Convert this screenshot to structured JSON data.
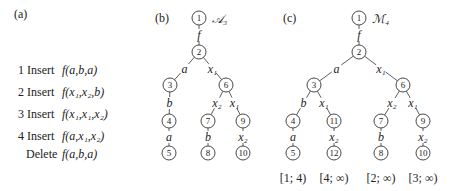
{
  "panel_a": {
    "tag": "(a)",
    "operations": [
      {
        "step": "1",
        "action": "Insert",
        "term": "f(a,b,a)"
      },
      {
        "step": "2",
        "action": "Insert",
        "term": "f(x₁,x₂,b)"
      },
      {
        "step": "3",
        "action": "Insert",
        "term": "f(x₁,x₁,x₂)"
      },
      {
        "step": "4",
        "action": "Insert",
        "term": "f(a,x₁,x₂)"
      },
      {
        "step": "",
        "action": "Delete",
        "term": "f(a,b,a)"
      }
    ]
  },
  "panel_b": {
    "tag": "(b)",
    "title": "𝒜₃",
    "nodes": [
      "1",
      "2",
      "3",
      "4",
      "5",
      "6",
      "7",
      "8",
      "9",
      "10"
    ],
    "edges": [
      {
        "from": "1",
        "to": "2",
        "label": "f"
      },
      {
        "from": "2",
        "to": "3",
        "label": "a"
      },
      {
        "from": "2",
        "to": "6",
        "label": "x₁"
      },
      {
        "from": "3",
        "to": "4",
        "label": "b"
      },
      {
        "from": "4",
        "to": "5",
        "label": "a"
      },
      {
        "from": "6",
        "to": "7",
        "label": "x₂"
      },
      {
        "from": "6",
        "to": "9",
        "label": "x₁"
      },
      {
        "from": "7",
        "to": "8",
        "label": "b"
      },
      {
        "from": "9",
        "to": "10",
        "label": "x₂"
      }
    ]
  },
  "panel_c": {
    "tag": "(c)",
    "title": "ℳ₄",
    "nodes": [
      "1",
      "2",
      "3",
      "4",
      "5",
      "11",
      "12",
      "6",
      "7",
      "8",
      "9",
      "10"
    ],
    "edges": [
      {
        "from": "1",
        "to": "2",
        "label": "f"
      },
      {
        "from": "2",
        "to": "3",
        "label": "a"
      },
      {
        "from": "2",
        "to": "6",
        "label": "x₁"
      },
      {
        "from": "3",
        "to": "4",
        "label": "b"
      },
      {
        "from": "3",
        "to": "11",
        "label": "x₁"
      },
      {
        "from": "4",
        "to": "5",
        "label": "a"
      },
      {
        "from": "11",
        "to": "12",
        "label": "x₂"
      },
      {
        "from": "6",
        "to": "7",
        "label": "x₂"
      },
      {
        "from": "6",
        "to": "9",
        "label": "x₁"
      },
      {
        "from": "7",
        "to": "8",
        "label": "b"
      },
      {
        "from": "9",
        "to": "10",
        "label": "x₂"
      }
    ],
    "leaf_intervals": [
      {
        "leaf": "5",
        "interval": "[1; 4)"
      },
      {
        "leaf": "12",
        "interval": "[4; ∞)"
      },
      {
        "leaf": "8",
        "interval": "[2; ∞)"
      },
      {
        "leaf": "10",
        "interval": "[3; ∞)"
      }
    ]
  }
}
